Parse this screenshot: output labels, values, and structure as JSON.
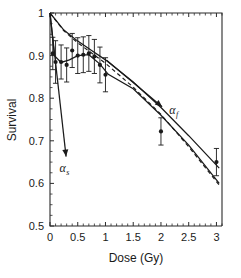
{
  "figure": {
    "background_color": "#ffffff",
    "ink_color": "#1a1a1a"
  },
  "chart_data": {
    "type": "scatter",
    "title": "",
    "subtitle": "",
    "xlabel": "Dose (Gy)",
    "ylabel": "Survival",
    "xlim": [
      0,
      3.1
    ],
    "ylim": [
      0.5,
      1.0
    ],
    "grid": false,
    "legend_position": "none",
    "x_ticks": [
      0,
      0.5,
      1,
      1.5,
      2,
      2.5,
      3
    ],
    "x_tick_labels": [
      "0",
      "0.5",
      "1",
      "1.5",
      "2",
      "2.5",
      "3"
    ],
    "x_minor_step": 0.1,
    "y_ticks": [
      0.5,
      0.6,
      0.7,
      0.8,
      0.9,
      1.0
    ],
    "y_tick_labels": [
      "0.5",
      "0.6",
      "0.7",
      "0.8",
      "0.9",
      "1"
    ],
    "y_minor_step": 0.025,
    "series": [
      {
        "name": "Measured survival",
        "type": "scatter",
        "marker": "filled-circle",
        "error_bars": "symmetric-y",
        "points": [
          {
            "x": 0.05,
            "y": 0.905,
            "yerr": 0.038
          },
          {
            "x": 0.1,
            "y": 0.885,
            "yerr": 0.05
          },
          {
            "x": 0.2,
            "y": 0.885,
            "yerr": 0.04
          },
          {
            "x": 0.3,
            "y": 0.878,
            "yerr": 0.04
          },
          {
            "x": 0.4,
            "y": 0.912,
            "yerr": 0.04
          },
          {
            "x": 0.5,
            "y": 0.9,
            "yerr": 0.042
          },
          {
            "x": 0.6,
            "y": 0.902,
            "yerr": 0.042
          },
          {
            "x": 0.7,
            "y": 0.905,
            "yerr": 0.042
          },
          {
            "x": 0.8,
            "y": 0.898,
            "yerr": 0.04
          },
          {
            "x": 0.9,
            "y": 0.878,
            "yerr": 0.042
          },
          {
            "x": 1.0,
            "y": 0.855,
            "yerr": 0.04
          },
          {
            "x": 2.0,
            "y": 0.722,
            "yerr": 0.032
          },
          {
            "x": 3.0,
            "y": 0.65,
            "yerr": 0.032
          }
        ]
      },
      {
        "name": "Induced-repair fit (solid)",
        "type": "line",
        "style": "solid",
        "path": [
          {
            "x": 0.0,
            "y": 1.0
          },
          {
            "x": 0.25,
            "y": 0.96
          },
          {
            "x": 0.5,
            "y": 0.934
          },
          {
            "x": 0.75,
            "y": 0.912
          },
          {
            "x": 1.0,
            "y": 0.89
          },
          {
            "x": 1.5,
            "y": 0.838
          },
          {
            "x": 2.0,
            "y": 0.778
          },
          {
            "x": 2.5,
            "y": 0.712
          },
          {
            "x": 3.05,
            "y": 0.636
          }
        ]
      },
      {
        "name": "Linear-quadratic fit (dashed)",
        "type": "line",
        "style": "dashed",
        "path": [
          {
            "x": 0.0,
            "y": 1.0
          },
          {
            "x": 0.25,
            "y": 0.958
          },
          {
            "x": 0.5,
            "y": 0.93
          },
          {
            "x": 0.75,
            "y": 0.906
          },
          {
            "x": 1.0,
            "y": 0.882
          },
          {
            "x": 1.5,
            "y": 0.826
          },
          {
            "x": 2.0,
            "y": 0.762
          },
          {
            "x": 2.5,
            "y": 0.686
          },
          {
            "x": 3.05,
            "y": 0.596
          }
        ]
      },
      {
        "name": "Low-dose data curve (solid through points)",
        "type": "line",
        "style": "solid",
        "path": [
          {
            "x": 0.0,
            "y": 1.0
          },
          {
            "x": 0.08,
            "y": 0.9
          },
          {
            "x": 0.2,
            "y": 0.884
          },
          {
            "x": 0.35,
            "y": 0.89
          },
          {
            "x": 0.5,
            "y": 0.9
          },
          {
            "x": 0.7,
            "y": 0.902
          },
          {
            "x": 0.9,
            "y": 0.88
          },
          {
            "x": 1.05,
            "y": 0.856
          },
          {
            "x": 1.5,
            "y": 0.822
          },
          {
            "x": 2.0,
            "y": 0.76
          },
          {
            "x": 2.5,
            "y": 0.69
          },
          {
            "x": 3.05,
            "y": 0.6
          }
        ]
      }
    ],
    "annotations": [
      {
        "id": "alpha-s",
        "label": "α",
        "subscript": "s",
        "meaning": "initial steep slope (alpha sensitive)",
        "arrow_from": {
          "x": 0.0,
          "y": 1.0
        },
        "arrow_to": {
          "x": 0.29,
          "y": 0.663
        },
        "text_at": {
          "x": 0.26,
          "y": 0.627
        }
      },
      {
        "id": "alpha-f",
        "label": "α",
        "subscript": "f",
        "meaning": "final shallow slope (alpha final)",
        "arrow_from": {
          "x": 1.02,
          "y": 0.889
        },
        "arrow_to": {
          "x": 2.02,
          "y": 0.78
        },
        "text_at": {
          "x": 2.23,
          "y": 0.762
        }
      }
    ]
  }
}
